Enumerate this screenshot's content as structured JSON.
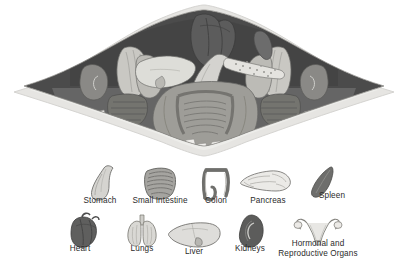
{
  "figure": {
    "title_visible": false,
    "background_color": "#ffffff"
  },
  "colors": {
    "page_background": "#ffffff",
    "body_outline": "#d8d8d6",
    "body_wall_light": "#e4e3e0",
    "cavity_dark": "#4e4e4e",
    "cavity_mid": "#6f6f6f",
    "organ_light": "#d2d2ce",
    "organ_mid": "#a9a9a5",
    "organ_dark": "#5a5a5a",
    "heart_dark": "#5f5f5f",
    "bone_white": "#f2f2f0",
    "outline_stroke": "#6b6b6b",
    "label_text": "#2b2b2b"
  },
  "cross_section": {
    "shape": "lens",
    "organs_depicted": [
      {
        "name": "heart",
        "position": "top-center"
      },
      {
        "name": "lung-left",
        "position": "upper-left"
      },
      {
        "name": "lung-right",
        "position": "upper-right"
      },
      {
        "name": "liver",
        "position": "left-of-center"
      },
      {
        "name": "stomach",
        "position": "center"
      },
      {
        "name": "pancreas",
        "position": "center-right"
      },
      {
        "name": "spleen",
        "position": "upper-right-inner"
      },
      {
        "name": "small-intestine",
        "position": "center-bottom"
      },
      {
        "name": "colon",
        "position": "center-bottom"
      },
      {
        "name": "kidney-left",
        "position": "far-left"
      },
      {
        "name": "kidney-right",
        "position": "far-right"
      },
      {
        "name": "vertebrae",
        "position": "lower-border"
      }
    ]
  },
  "legend": {
    "row1": [
      {
        "label": "Stomach",
        "icon": "stomach-icon",
        "cx": 100,
        "label_y": 203
      },
      {
        "label": "Small Intestine",
        "icon": "small-intestine-icon",
        "cx": 160,
        "label_y": 203
      },
      {
        "label": "Colon",
        "icon": "colon-icon",
        "cx": 216,
        "label_y": 203
      },
      {
        "label": "Pancreas",
        "icon": "pancreas-icon",
        "cx": 268,
        "label_y": 203
      },
      {
        "label": "Spleen",
        "icon": "spleen-icon",
        "cx": 330,
        "label_y": 198
      }
    ],
    "row2": [
      {
        "label": "Heart",
        "icon": "heart-icon",
        "cx": 84,
        "label_y": 251
      },
      {
        "label": "Lungs",
        "icon": "lungs-icon",
        "cx": 142,
        "label_y": 251
      },
      {
        "label": "Liver",
        "icon": "liver-icon",
        "cx": 196,
        "label_y": 254
      },
      {
        "label": "Kidneys",
        "icon": "kidneys-icon",
        "cx": 250,
        "label_y": 251
      },
      {
        "label": "Hormonal and",
        "icon": "reproductive-organs-icon",
        "cx": 318,
        "label_y": 246
      },
      {
        "label": "Reproductive Organs",
        "icon": null,
        "cx": 318,
        "label_y": 256
      }
    ]
  }
}
